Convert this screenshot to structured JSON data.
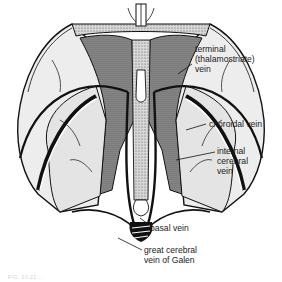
{
  "figure": {
    "labels": [
      {
        "id": "terminal",
        "text": "terminal\n(thalamostriate)\nvein",
        "x": 195,
        "y": 44
      },
      {
        "id": "choroidal",
        "text": "choroidal vein",
        "x": 209,
        "y": 119
      },
      {
        "id": "internal-cerebral",
        "text": "internal\ncerebral\nvein",
        "x": 217,
        "y": 146
      },
      {
        "id": "basal",
        "text": "basal vein",
        "x": 150,
        "y": 223
      },
      {
        "id": "great-cerebral",
        "text": "great cerebral\nvein of Galen",
        "x": 144,
        "y": 245
      }
    ],
    "caption": "FIG. 10.21 ..."
  },
  "colors": {
    "line": "#111111",
    "shade": "#bdbdbd",
    "light": "#e9e9e9",
    "background": "#ffffff"
  }
}
